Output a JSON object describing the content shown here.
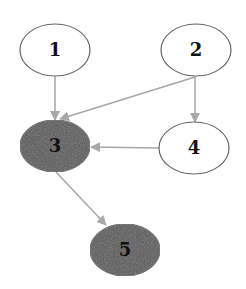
{
  "diagram": {
    "type": "directed-graph",
    "colors": {
      "background": "#ffffff",
      "node_stroke": "#666666",
      "edge": "#a8a8a8",
      "node_fill_white": "#ffffff",
      "node_fill_dark": "#5a5a5a",
      "label": "#111111"
    },
    "nodes": [
      {
        "id": "1",
        "label": "1",
        "cx": 55,
        "cy": 50,
        "rx": 35,
        "ry": 26,
        "filled": false
      },
      {
        "id": "2",
        "label": "2",
        "cx": 196,
        "cy": 50,
        "rx": 35,
        "ry": 26,
        "filled": false
      },
      {
        "id": "3",
        "label": "3",
        "cx": 55,
        "cy": 146,
        "rx": 35,
        "ry": 26,
        "filled": true
      },
      {
        "id": "4",
        "label": "4",
        "cx": 194,
        "cy": 148,
        "rx": 35,
        "ry": 26,
        "filled": false
      },
      {
        "id": "5",
        "label": "5",
        "cx": 125,
        "cy": 250,
        "rx": 35,
        "ry": 26,
        "filled": true
      }
    ],
    "edges": [
      {
        "from": "1",
        "to": "3",
        "x1": 55,
        "y1": 76,
        "x2": 55,
        "y2": 120
      },
      {
        "from": "2",
        "to": "3",
        "x1": 195,
        "y1": 77,
        "x2": 60,
        "y2": 119
      },
      {
        "from": "2",
        "to": "4",
        "x1": 195,
        "y1": 77,
        "x2": 195,
        "y2": 122
      },
      {
        "from": "4",
        "to": "3",
        "x1": 159,
        "y1": 148,
        "x2": 91,
        "y2": 147
      },
      {
        "from": "3",
        "to": "5",
        "x1": 56,
        "y1": 172,
        "x2": 106,
        "y2": 225
      }
    ]
  }
}
